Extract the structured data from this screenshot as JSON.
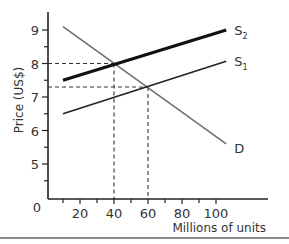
{
  "chart_data": {
    "type": "line",
    "title": "",
    "xlabel": "Millions of units",
    "ylabel": "Price (US$)",
    "xlim": [
      0,
      120
    ],
    "ylim": [
      4.0,
      9.3
    ],
    "x_ticks": [
      20,
      40,
      60,
      80,
      100
    ],
    "x_tick_labels": [
      "20",
      "40",
      "60",
      "80",
      "100"
    ],
    "x_minor_ticks": [
      10,
      30,
      50,
      70,
      90
    ],
    "y_ticks": [
      5,
      6,
      7,
      8,
      9
    ],
    "y_tick_labels": [
      "5",
      "6",
      "7",
      "8",
      "9"
    ],
    "y_minor_ticks": [
      4.5,
      5.5,
      6.5,
      7.5,
      8.5
    ],
    "origin_label": "0",
    "grid": false,
    "legend": "none (lines labeled at right end)",
    "series": [
      {
        "name": "D",
        "label": "D",
        "sub": "",
        "x": [
          10,
          106
        ],
        "y": [
          9.1,
          5.6
        ],
        "color": "#6e6e6e",
        "width": 1.6
      },
      {
        "name": "S1",
        "label": "S",
        "sub": "1",
        "x": [
          10,
          106
        ],
        "y": [
          6.5,
          8.07
        ],
        "color": "#222222",
        "width": 1.6
      },
      {
        "name": "S2",
        "label": "S",
        "sub": "2",
        "x": [
          10,
          106
        ],
        "y": [
          7.5,
          9.0
        ],
        "color": "#111111",
        "width": 3.2
      }
    ],
    "annotations": [
      {
        "type": "equilibrium",
        "between": [
          "D",
          "S2"
        ],
        "x": 40,
        "y": 8.0,
        "dashed_guides": true
      },
      {
        "type": "equilibrium",
        "between": [
          "D",
          "S1"
        ],
        "x": 60,
        "y": 7.3,
        "dashed_guides": true
      }
    ]
  }
}
